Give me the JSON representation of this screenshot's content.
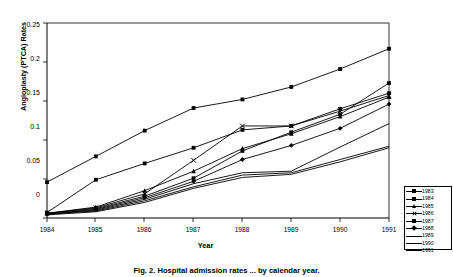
{
  "chart_data": {
    "type": "line",
    "title": "",
    "xlabel": "Year",
    "ylabel": "Angioplasty (PTCA) Rates",
    "x": [
      1984,
      1985,
      1986,
      1987,
      1988,
      1989,
      1990,
      1991
    ],
    "xtick_labels": [
      "1984",
      "1985",
      "1986",
      "1987",
      "1988",
      "1989",
      "1990",
      "1991"
    ],
    "ytick_labels": [
      "0",
      "0.05",
      "0.1",
      "0.15",
      "0.2",
      "0.25"
    ],
    "ylim": [
      0,
      0.25
    ],
    "xlim": [
      1984,
      1991
    ],
    "grid": false,
    "legend_position": "right-bottom",
    "series": [
      {
        "name": "1983",
        "marker": "square",
        "values": [
          0.046,
          0.079,
          0.112,
          0.141,
          0.152,
          0.168,
          0.191,
          0.217
        ]
      },
      {
        "name": "1984",
        "marker": "square",
        "values": [
          0.007,
          0.049,
          0.07,
          0.09,
          0.113,
          0.118,
          0.14,
          0.16
        ]
      },
      {
        "name": "1985",
        "marker": "triangle",
        "values": [
          0.006,
          0.014,
          0.035,
          0.06,
          0.089,
          0.108,
          0.13,
          0.155
        ]
      },
      {
        "name": "1986",
        "marker": "x",
        "values": [
          0.006,
          0.013,
          0.031,
          0.074,
          0.118,
          0.118,
          0.137,
          0.157
        ]
      },
      {
        "name": "1987",
        "marker": "square",
        "values": [
          0.006,
          0.012,
          0.028,
          0.051,
          0.086,
          0.11,
          0.133,
          0.173
        ]
      },
      {
        "name": "1988",
        "marker": "diamond",
        "values": [
          0.005,
          0.011,
          0.026,
          0.047,
          0.075,
          0.093,
          0.115,
          0.146
        ]
      },
      {
        "name": "1989",
        "marker": "line",
        "values": [
          0.005,
          0.01,
          0.024,
          0.044,
          0.058,
          0.06,
          0.091,
          0.121
        ]
      },
      {
        "name": "1990",
        "marker": "line",
        "values": [
          0.005,
          0.009,
          0.022,
          0.04,
          0.055,
          0.058,
          0.075,
          0.092
        ]
      },
      {
        "name": "1991",
        "marker": "line",
        "values": [
          0.004,
          0.008,
          0.02,
          0.038,
          0.052,
          0.056,
          0.072,
          0.09
        ]
      }
    ]
  },
  "legend": {
    "entries": [
      "1983",
      "1984",
      "1985",
      "1986",
      "1987",
      "1988",
      "1989",
      "1990",
      "1991"
    ]
  },
  "caption": {
    "text": "Fig. 2. Hospital admission rates ... by calendar year."
  }
}
